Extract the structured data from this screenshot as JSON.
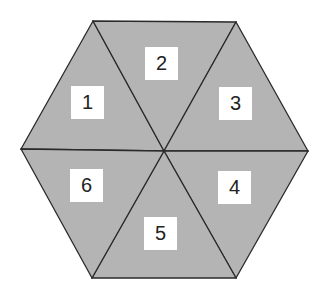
{
  "diagram": {
    "type": "hexagon-divided-into-six-triangles",
    "fill_color": "#b4b4b4",
    "stroke_color": "#2a2a2a",
    "background": "#ffffff",
    "center": [
      164,
      151
    ],
    "vertices": {
      "top_left": [
        93,
        21
      ],
      "top_right": [
        236,
        22
      ],
      "right": [
        308,
        151
      ],
      "bottom_right": [
        236,
        278
      ],
      "bottom_left": [
        92,
        278
      ],
      "left": [
        21,
        149
      ]
    },
    "segments": [
      {
        "id": "1",
        "label": "1",
        "box": [
          71,
          86
        ]
      },
      {
        "id": "2",
        "label": "2",
        "box": [
          145,
          47
        ]
      },
      {
        "id": "3",
        "label": "3",
        "box": [
          219,
          87
        ]
      },
      {
        "id": "4",
        "label": "4",
        "box": [
          218,
          171
        ]
      },
      {
        "id": "5",
        "label": "5",
        "box": [
          144,
          217
        ]
      },
      {
        "id": "6",
        "label": "6",
        "box": [
          70,
          169
        ]
      }
    ]
  }
}
